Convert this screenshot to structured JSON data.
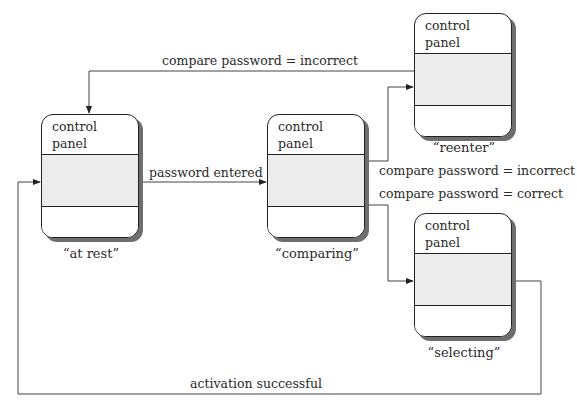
{
  "diagram": {
    "type": "state-diagram",
    "states": [
      {
        "id": "at_rest",
        "header_line1": "control",
        "header_line2": "panel",
        "caption": "“at rest”"
      },
      {
        "id": "comparing",
        "header_line1": "control",
        "header_line2": "panel",
        "caption": "“comparing”"
      },
      {
        "id": "reenter",
        "header_line1": "control",
        "header_line2": "panel",
        "caption": "“reenter”"
      },
      {
        "id": "selecting",
        "header_line1": "control",
        "header_line2": "panel",
        "caption": "“selecting”"
      }
    ],
    "transitions": [
      {
        "from": "reenter",
        "to": "at_rest",
        "label": "compare password = incorrect"
      },
      {
        "from": "at_rest",
        "to": "comparing",
        "label": "password entered"
      },
      {
        "from": "comparing",
        "to": "reenter",
        "label": "compare password = incorrect"
      },
      {
        "from": "comparing",
        "to": "selecting",
        "label": "compare password = correct"
      },
      {
        "from": "selecting",
        "to": "at_rest",
        "label": "activation successful"
      }
    ],
    "colors": {
      "line": "#333333",
      "box_border": "#222222",
      "box_fill_middle": "#ececec",
      "shadow": "#6e6e6e"
    }
  }
}
